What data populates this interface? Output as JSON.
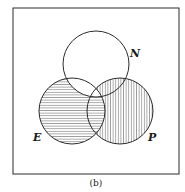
{
  "figure": {
    "caption": "(b)",
    "frame": {
      "x": 13,
      "y": 8,
      "width": 166,
      "height": 166
    },
    "sets": [
      {
        "id": "N",
        "label": "N",
        "cx": 96,
        "cy": 64,
        "r": 33,
        "label_x": 130,
        "label_y": 57
      },
      {
        "id": "E",
        "label": "E",
        "cx": 72,
        "cy": 111,
        "r": 33,
        "label_x": 33,
        "label_y": 141
      },
      {
        "id": "P",
        "label": "P",
        "cx": 120,
        "cy": 111,
        "r": 33,
        "label_x": 148,
        "label_y": 141
      }
    ],
    "shaded_regions": [
      {
        "region": "E minus N",
        "pattern": "horizontal-hatch"
      },
      {
        "region": "P minus E",
        "pattern": "vertical-hatch"
      }
    ],
    "colors": {
      "line": "#2a2a2a",
      "hatch": "#555555",
      "background": "#ffffff"
    }
  }
}
